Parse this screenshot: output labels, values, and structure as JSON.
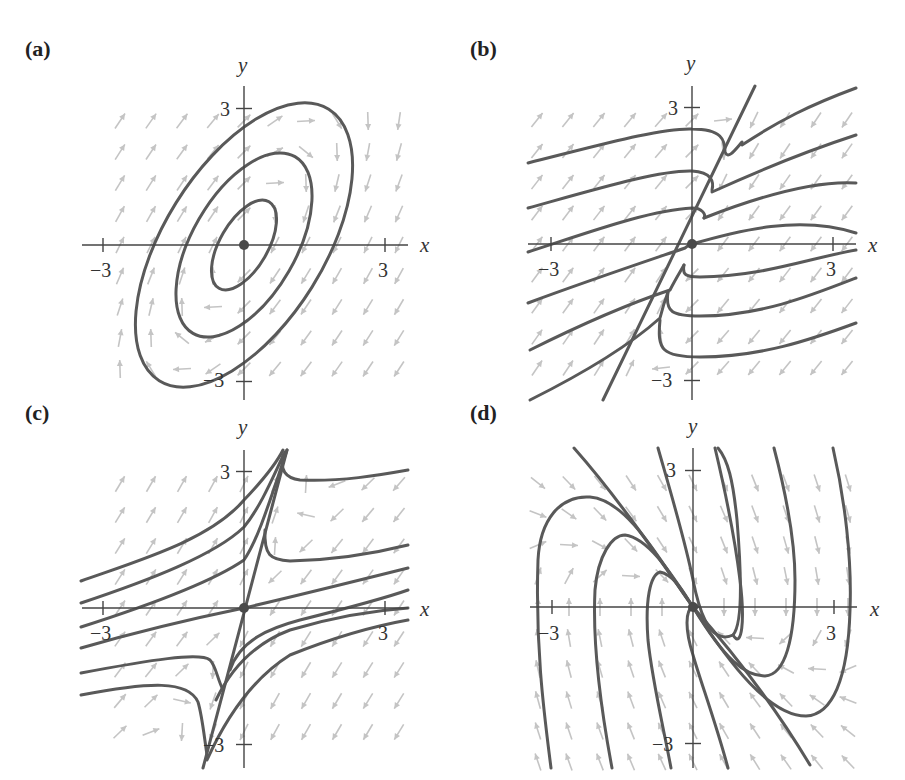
{
  "figure": {
    "panels": [
      {
        "id": "a",
        "label": "(a)",
        "type": "center",
        "x_axis_label": "x",
        "y_axis_label": "y",
        "tick_labels": {
          "x_neg": "−3",
          "x_pos": "3",
          "y_pos": "3",
          "y_neg": "−3"
        },
        "origin_px": [
          244,
          245
        ],
        "scale_px": [
          47,
          45.5
        ],
        "x_extent": [
          82,
          408
        ],
        "y_extent": [
          86,
          400
        ],
        "label_px": [
          25,
          56
        ],
        "matrix": [
          [
            -1,
            1
          ],
          [
            -2,
            1
          ]
        ]
      },
      {
        "id": "b",
        "label": "(b)",
        "type": "node-degenerate",
        "x_axis_label": "x",
        "y_axis_label": "y",
        "tick_labels": {
          "x_neg": "−3",
          "x_pos": "3",
          "y_pos": "3",
          "y_neg": "−3"
        },
        "origin_px": [
          692,
          244
        ],
        "scale_px": [
          47,
          45.5
        ],
        "x_extent": [
          528,
          856
        ],
        "y_extent": [
          86,
          400
        ],
        "label_px": [
          470,
          56
        ],
        "matrix": [
          [
            -3,
            1
          ],
          [
            -4,
            1
          ]
        ]
      },
      {
        "id": "c",
        "label": "(c)",
        "type": "saddle",
        "x_axis_label": "x",
        "y_axis_label": "y",
        "tick_labels": {
          "x_neg": "−3",
          "x_pos": "3",
          "y_pos": "3",
          "y_neg": "−3"
        },
        "origin_px": [
          244,
          608
        ],
        "scale_px": [
          47,
          45.5
        ],
        "x_extent": [
          82,
          408
        ],
        "y_extent": [
          450,
          768
        ],
        "label_px": [
          25,
          420
        ],
        "matrix": [
          [
            -2,
            1
          ],
          [
            -3,
            2
          ]
        ]
      },
      {
        "id": "d",
        "label": "(d)",
        "type": "degenerate-node",
        "x_axis_label": "x",
        "y_axis_label": "y",
        "tick_labels": {
          "x_neg": "−3",
          "x_pos": "3",
          "y_pos": "3",
          "y_neg": "−3"
        },
        "origin_px": [
          693,
          607
        ],
        "scale_px": [
          47,
          45.5
        ],
        "x_extent": [
          530,
          857
        ],
        "y_extent": [
          448,
          768
        ],
        "label_px": [
          470,
          420
        ],
        "matrix": [
          [
            0,
            1
          ],
          [
            -1,
            -2
          ]
        ]
      }
    ],
    "colors": {
      "trajectory": "#595959",
      "field_arrow": "#c4c4c4",
      "axis": "#444444",
      "text": "#222222"
    }
  }
}
